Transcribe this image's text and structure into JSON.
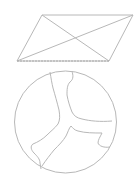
{
  "stroke_color": "#b8b8b8",
  "figures": {
    "parallelogram": {
      "shape": "parallelogram-with-diagonals",
      "vertices": [
        [
          42,
          15
        ],
        [
          133,
          15
        ],
        [
          109,
          61
        ],
        [
          17,
          61
        ]
      ]
    },
    "circle": {
      "shape": "circle-with-branching-crack",
      "center": [
        65.5,
        122
      ],
      "radius": 51
    }
  }
}
